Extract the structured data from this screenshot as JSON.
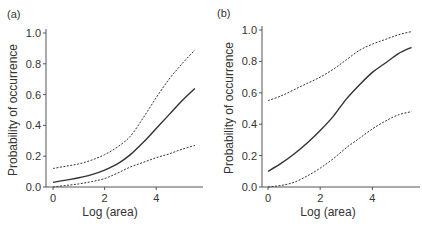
{
  "chart_data": [
    {
      "panel": "(a)",
      "type": "line",
      "xlabel": "Log (area)",
      "ylabel": "Probability of occurrence",
      "xlim": [
        0,
        5.5
      ],
      "ylim": [
        0,
        1.0
      ],
      "xticks": [
        "0",
        "2",
        "4"
      ],
      "yticks": [
        "0.0",
        "0.2",
        "0.4",
        "0.6",
        "0.8",
        "1.0"
      ],
      "grid": false,
      "x": [
        0,
        0.5,
        1,
        1.5,
        2,
        2.5,
        3,
        3.5,
        4,
        4.5,
        5,
        5.5
      ],
      "series": [
        {
          "name": "fitted",
          "style": "solid",
          "values": [
            0.03,
            0.045,
            0.06,
            0.08,
            0.11,
            0.15,
            0.21,
            0.29,
            0.38,
            0.47,
            0.56,
            0.64
          ]
        },
        {
          "name": "upper CI",
          "style": "dotted",
          "values": [
            0.12,
            0.135,
            0.15,
            0.175,
            0.21,
            0.26,
            0.33,
            0.45,
            0.58,
            0.7,
            0.8,
            0.89
          ]
        },
        {
          "name": "lower CI",
          "style": "dotted",
          "values": [
            0.0,
            0.01,
            0.02,
            0.035,
            0.055,
            0.09,
            0.13,
            0.16,
            0.19,
            0.215,
            0.245,
            0.27
          ]
        }
      ]
    },
    {
      "panel": "(b)",
      "type": "line",
      "xlabel": "Log (area)",
      "ylabel": "Probability of occurrence",
      "xlim": [
        0,
        5.5
      ],
      "ylim": [
        0,
        1.0
      ],
      "xticks": [
        "0",
        "2",
        "4"
      ],
      "yticks": [
        "0.0",
        "0.2",
        "0.4",
        "0.6",
        "0.8",
        "1.0"
      ],
      "grid": false,
      "x": [
        0,
        0.5,
        1,
        1.5,
        2,
        2.5,
        3,
        3.5,
        4,
        4.5,
        5,
        5.5
      ],
      "series": [
        {
          "name": "fitted",
          "style": "solid",
          "values": [
            0.1,
            0.15,
            0.21,
            0.28,
            0.36,
            0.45,
            0.56,
            0.65,
            0.73,
            0.79,
            0.85,
            0.89
          ]
        },
        {
          "name": "upper CI",
          "style": "dotted",
          "values": [
            0.55,
            0.58,
            0.62,
            0.66,
            0.7,
            0.75,
            0.81,
            0.87,
            0.91,
            0.94,
            0.97,
            0.99
          ]
        },
        {
          "name": "lower CI",
          "style": "dotted",
          "values": [
            0.0,
            0.01,
            0.03,
            0.07,
            0.12,
            0.18,
            0.25,
            0.31,
            0.37,
            0.42,
            0.46,
            0.48
          ]
        }
      ]
    }
  ],
  "panels": [
    {
      "label": "(a)",
      "xlabel": "Log (area)",
      "ylabel": "Probability of occurrence"
    },
    {
      "label": "(b)",
      "xlabel": "Log (area)",
      "ylabel": "Probability of occurrence"
    }
  ],
  "colors": {
    "axis": "#555555",
    "line": "#333333",
    "text": "#333333"
  }
}
